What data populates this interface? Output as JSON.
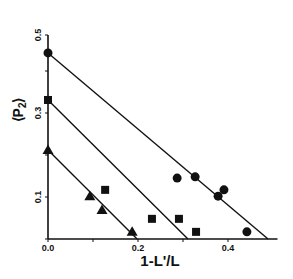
{
  "chart_data": {
    "type": "scatter",
    "title": "",
    "xlabel": "1-L'/L",
    "ylabel": "⟨P₂⟩",
    "ylabel_main": "P",
    "ylabel_sub": "2",
    "xlim": [
      0.0,
      0.51
    ],
    "ylim": [
      0.0,
      0.5
    ],
    "x_ticks": [
      0.0,
      0.1,
      0.2,
      0.3,
      0.4
    ],
    "x_tick_labels": [
      "0.0",
      "",
      "0.2",
      "",
      "0.4"
    ],
    "y_ticks": [
      0.0,
      0.1,
      0.2,
      0.3,
      0.4,
      0.5
    ],
    "y_tick_labels": [
      "",
      "0.1",
      "",
      "0.3",
      "",
      "0.5"
    ],
    "grid": false,
    "legend": null,
    "series": [
      {
        "name": "circles",
        "marker": "circle",
        "points": [
          [
            0.0,
            0.443
          ],
          [
            0.287,
            0.145
          ],
          [
            0.327,
            0.148
          ],
          [
            0.378,
            0.102
          ],
          [
            0.391,
            0.117
          ],
          [
            0.442,
            0.017
          ]
        ],
        "fit_line": [
          [
            0.0,
            0.443
          ],
          [
            0.489,
            0.0
          ]
        ]
      },
      {
        "name": "squares",
        "marker": "square",
        "points": [
          [
            0.0,
            0.331
          ],
          [
            0.127,
            0.117
          ],
          [
            0.231,
            0.048
          ],
          [
            0.291,
            0.048
          ],
          [
            0.329,
            0.017
          ]
        ],
        "fit_line": [
          [
            0.0,
            0.331
          ],
          [
            0.311,
            0.0
          ]
        ]
      },
      {
        "name": "triangles",
        "marker": "triangle",
        "points": [
          [
            0.0,
            0.212
          ],
          [
            0.093,
            0.102
          ],
          [
            0.12,
            0.069
          ],
          [
            0.187,
            0.017
          ]
        ],
        "fit_line": [
          [
            0.0,
            0.212
          ],
          [
            0.198,
            0.0
          ]
        ]
      }
    ]
  },
  "colors": {
    "ink": "#111111",
    "background": "#ffffff"
  }
}
